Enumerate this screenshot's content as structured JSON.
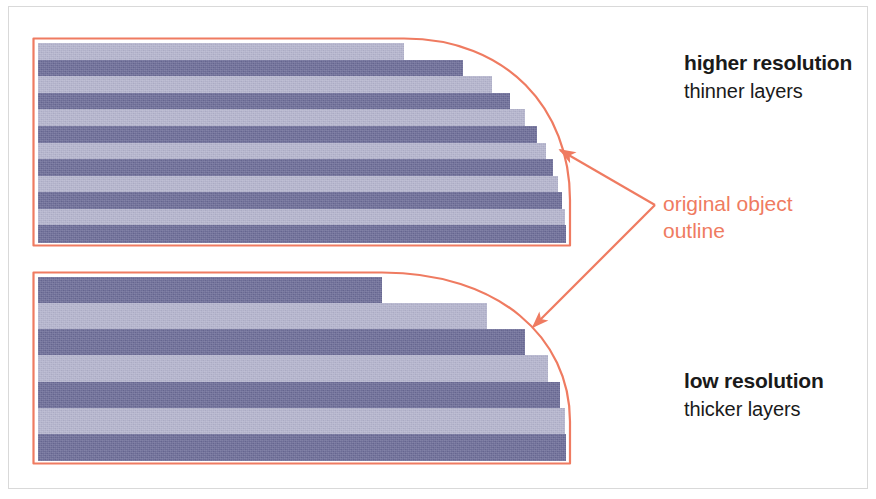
{
  "figure": {
    "colors": {
      "outline": "#ef7b61",
      "layer_dark": "#6a6a96",
      "layer_light": "#b3b3cd",
      "text": "#1a1a1a",
      "background": "#ffffff",
      "frame": "#d9d9d9"
    }
  },
  "callouts": {
    "high": {
      "heading": "higher resolution",
      "subtext": "thinner layers"
    },
    "low": {
      "heading": "low resolution",
      "subtext": "thicker layers"
    },
    "outline": {
      "line1": "original object",
      "line2": "outline"
    }
  },
  "shapes": {
    "high_resolution": {
      "label": "higher resolution stack",
      "layer_count": 12,
      "layer_thickness_px": 16.6,
      "top_y": 43,
      "bottom_y": 242,
      "left_x": 38,
      "flat_right_x": 404,
      "max_right_x": 566,
      "layers": [
        {
          "index": 1,
          "fill": "light",
          "right_x": 404
        },
        {
          "index": 2,
          "fill": "dark",
          "right_x": 463
        },
        {
          "index": 3,
          "fill": "light",
          "right_x": 492
        },
        {
          "index": 4,
          "fill": "dark",
          "right_x": 510
        },
        {
          "index": 5,
          "fill": "light",
          "right_x": 525
        },
        {
          "index": 6,
          "fill": "dark",
          "right_x": 537
        },
        {
          "index": 7,
          "fill": "light",
          "right_x": 546
        },
        {
          "index": 8,
          "fill": "dark",
          "right_x": 553
        },
        {
          "index": 9,
          "fill": "light",
          "right_x": 558
        },
        {
          "index": 10,
          "fill": "dark",
          "right_x": 562
        },
        {
          "index": 11,
          "fill": "light",
          "right_x": 565
        },
        {
          "index": 12,
          "fill": "dark",
          "right_x": 566
        }
      ]
    },
    "low_resolution": {
      "label": "low resolution stack",
      "layer_count": 7,
      "layer_thickness_px": 26.1,
      "top_y": 277,
      "bottom_y": 460,
      "left_x": 38,
      "flat_right_x": 382,
      "max_right_x": 566,
      "layers": [
        {
          "index": 1,
          "fill": "dark",
          "right_x": 382
        },
        {
          "index": 2,
          "fill": "light",
          "right_x": 487
        },
        {
          "index": 3,
          "fill": "dark",
          "right_x": 525
        },
        {
          "index": 4,
          "fill": "light",
          "right_x": 548
        },
        {
          "index": 5,
          "fill": "dark",
          "right_x": 560
        },
        {
          "index": 6,
          "fill": "light",
          "right_x": 565
        },
        {
          "index": 7,
          "fill": "dark",
          "right_x": 566
        }
      ]
    }
  },
  "annotations": {
    "arrows": [
      {
        "name": "arrow-to-high-res-outline",
        "from_x": 655,
        "from_y": 205,
        "to_x": 560,
        "to_y": 150
      },
      {
        "name": "arrow-to-low-res-outline",
        "from_x": 655,
        "from_y": 205,
        "to_x": 533,
        "to_y": 327
      }
    ]
  }
}
